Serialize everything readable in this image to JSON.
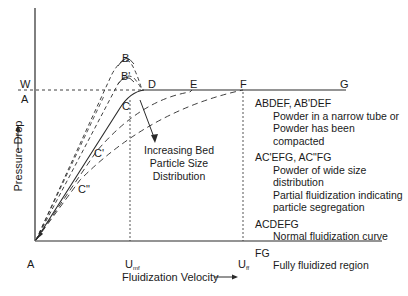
{
  "diagram": {
    "title": "",
    "axes": {
      "x_label": "Fluidization Velocity",
      "y_label": "Pressure Drop",
      "origin_label": "A"
    },
    "levels": {
      "w_label": "W",
      "a_label": "A"
    },
    "points": {
      "B": "B",
      "B_prime": "B'",
      "C": "C",
      "C_prime": "C'",
      "C_double": "C\"",
      "D": "D",
      "E": "E",
      "F": "F",
      "G": "G"
    },
    "x_ticks": [
      {
        "base": "U",
        "sub": "mf"
      },
      {
        "base": "U",
        "sub": "ff"
      }
    ],
    "annotation": {
      "lines": [
        "Increasing Bed",
        "Particle Size",
        "Distribution"
      ]
    },
    "legend": [
      {
        "key": "ABDEF, AB'DEF",
        "lines": [
          "Powder in a narrow tube or",
          "Powder has been compacted"
        ]
      },
      {
        "key": "AC'EFG, AC\"FG",
        "lines": [
          "Powder of wide size distribution",
          "Partial fluidization indicating",
          "particle segregation"
        ]
      },
      {
        "key": "ACDEFG",
        "lines": [
          "Normal fluidization curve"
        ]
      },
      {
        "key": "FG",
        "lines": [
          "Fully fluidized region"
        ]
      }
    ],
    "colors": {
      "line": "#2a2a2a",
      "background": "#ffffff"
    }
  }
}
